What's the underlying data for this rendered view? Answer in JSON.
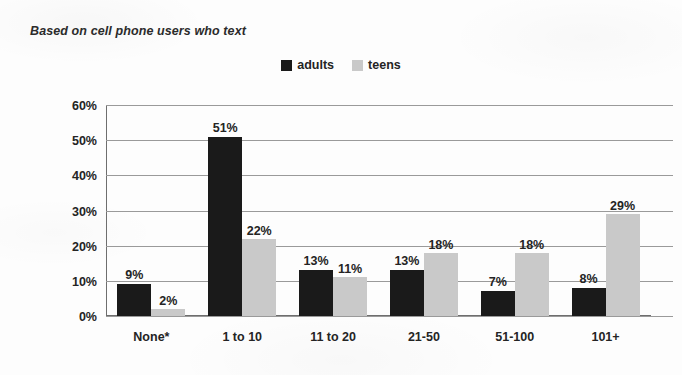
{
  "subtitle": "Based on cell phone users who text",
  "legend": {
    "position": "top-center",
    "items": [
      {
        "label": "adults",
        "color": "#1a1a1a",
        "swatch": "legend-swatch-adults"
      },
      {
        "label": "teens",
        "color": "#c9c9c9",
        "swatch": "legend-swatch-teens"
      }
    ]
  },
  "chart_data": {
    "type": "bar",
    "title": "",
    "subtitle": "Based on cell phone users who text",
    "xlabel": "",
    "ylabel": "",
    "ylim": [
      0,
      60
    ],
    "yticks": [
      "0%",
      "10%",
      "20%",
      "30%",
      "40%",
      "50%",
      "60%"
    ],
    "ytick_values": [
      0,
      10,
      20,
      30,
      40,
      50,
      60
    ],
    "grid": true,
    "legend_position": "top-center",
    "categories": [
      "None*",
      "1 to 10",
      "11 to 20",
      "21-50",
      "51-100",
      "101+"
    ],
    "series": [
      {
        "name": "adults",
        "color": "#1a1a1a",
        "values": [
          9,
          51,
          13,
          13,
          7,
          8
        ],
        "labels": [
          "9%",
          "51%",
          "13%",
          "13%",
          "7%",
          "8%"
        ]
      },
      {
        "name": "teens",
        "color": "#c9c9c9",
        "values": [
          2,
          22,
          11,
          18,
          18,
          29
        ],
        "labels": [
          "2%",
          "22%",
          "11%",
          "18%",
          "18%",
          "29%"
        ]
      }
    ]
  }
}
